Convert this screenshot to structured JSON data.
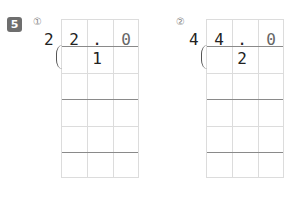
{
  "header_cutoff": "- - - - - -",
  "problem": {
    "number": "5"
  },
  "items": [
    {
      "label": "①",
      "divisor": "2",
      "dividend_cells": [
        "2",
        ". 1",
        "0"
      ]
    },
    {
      "label": "②",
      "divisor": "4",
      "dividend_cells": [
        "4",
        ". 2",
        "0"
      ]
    }
  ],
  "colors": {
    "badge": "#6e6e6e",
    "grid_line": "#dcdcdc",
    "thick_line": "#8a8a8a"
  }
}
